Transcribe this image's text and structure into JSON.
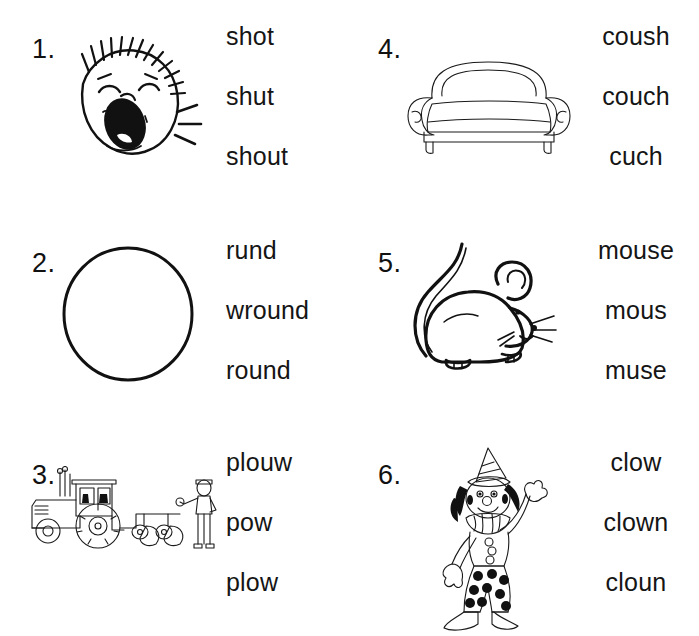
{
  "worksheet": {
    "type": "phonics-spelling-choice-worksheet",
    "columns": 2,
    "rows": 3,
    "items": [
      {
        "number": "1.",
        "picture": "shouting-face",
        "picture_label": "face shouting with open mouth, spiky hair and sound lines",
        "options": [
          "shot",
          "shut",
          "shout"
        ]
      },
      {
        "number": "2.",
        "picture": "circle",
        "picture_label": "large plain circle",
        "options": [
          "rund",
          "wround",
          "round"
        ]
      },
      {
        "number": "3.",
        "picture": "tractor-with-plow",
        "picture_label": "tractor pulling a plow with a farmer standing beside it",
        "options": [
          "plouw",
          "pow",
          "plow"
        ]
      },
      {
        "number": "4.",
        "picture": "couch",
        "picture_label": "sofa with rolled arms and cushion",
        "options": [
          "coush",
          "couch",
          "cuch"
        ]
      },
      {
        "number": "5.",
        "picture": "mouse",
        "picture_label": "mouse with long curled tail and whiskers",
        "options": [
          "mouse",
          "mous",
          "muse"
        ]
      },
      {
        "number": "6.",
        "picture": "clown",
        "picture_label": "clown with pointed hat, ruffled collar and polka dot pants",
        "options": [
          "clow",
          "clown",
          "cloun"
        ]
      }
    ]
  },
  "colors": {
    "background": "#ffffff",
    "ink": "#111111",
    "text": "#151515"
  }
}
